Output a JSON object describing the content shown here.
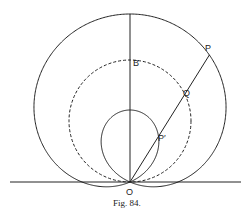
{
  "figure": {
    "caption": "Fig. 84.",
    "labels": {
      "B": "B",
      "P": "P",
      "Q": "Q",
      "P_prime": "P′",
      "O": "O"
    },
    "geometry": {
      "origin": [
        130,
        182
      ],
      "baseline_y": 182,
      "dashed_circle": {
        "cx": 130,
        "cy": 121,
        "r": 61
      },
      "limacon": {
        "equation": "r = 120 sinθ + 48",
        "a": 120,
        "b": 48
      },
      "ray_angle_deg": 58
    },
    "colors": {
      "stroke": "#222222",
      "background": "#ffffff"
    }
  }
}
